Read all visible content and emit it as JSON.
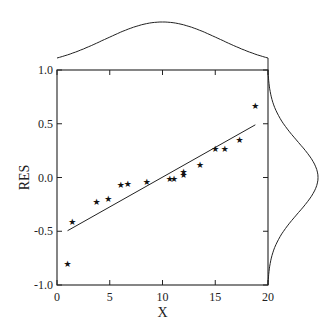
{
  "chart_data": {
    "type": "scatter",
    "title": "",
    "xlabel": "X",
    "ylabel": "RES",
    "xlim": [
      0,
      20
    ],
    "ylim": [
      -1.0,
      1.0
    ],
    "x_ticks": [
      0,
      5,
      10,
      15,
      20
    ],
    "x_tick_labels": [
      "0",
      "5",
      "10",
      "15",
      "20"
    ],
    "y_ticks": [
      1.0,
      0.5,
      0.0,
      -0.5,
      -1.0
    ],
    "y_tick_labels": [
      "1.0",
      "0.5",
      "0.0",
      "-0.5",
      "-1.0"
    ],
    "grid": false,
    "marker": "star",
    "marker_glyph": "★",
    "series": [
      {
        "name": "residuals",
        "points": [
          {
            "x": 1.0,
            "y": -0.8
          },
          {
            "x": 1.45,
            "y": -0.41
          },
          {
            "x": 3.75,
            "y": -0.23
          },
          {
            "x": 4.85,
            "y": -0.2
          },
          {
            "x": 6.05,
            "y": -0.07
          },
          {
            "x": 6.7,
            "y": -0.055
          },
          {
            "x": 8.5,
            "y": -0.04
          },
          {
            "x": 10.7,
            "y": -0.015
          },
          {
            "x": 11.1,
            "y": -0.015
          },
          {
            "x": 12.0,
            "y": 0.025
          },
          {
            "x": 12.0,
            "y": 0.055
          },
          {
            "x": 13.55,
            "y": 0.115
          },
          {
            "x": 15.0,
            "y": 0.265
          },
          {
            "x": 15.9,
            "y": 0.27
          },
          {
            "x": 17.3,
            "y": 0.35
          },
          {
            "x": 18.8,
            "y": 0.665
          }
        ]
      }
    ],
    "fit_line": {
      "x": [
        1.0,
        18.8
      ],
      "y": [
        -0.495,
        0.49
      ]
    },
    "marginal_top": {
      "type": "normal-density",
      "mean": 10.0,
      "sd": 5.5,
      "axis": "x"
    },
    "marginal_right": {
      "type": "normal-density",
      "mean": 0.0,
      "sd": 0.33,
      "axis": "y"
    }
  }
}
